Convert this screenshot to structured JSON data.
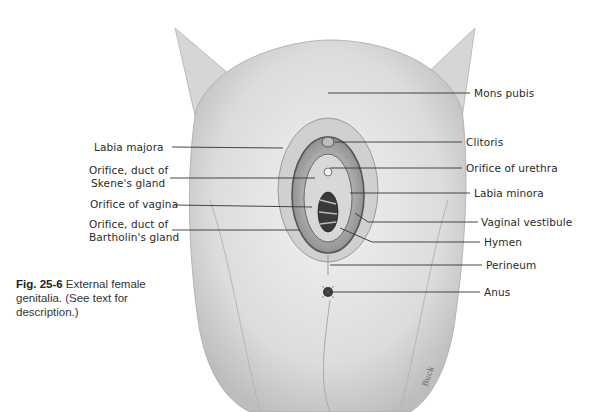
{
  "figure": {
    "number_label": "Fig. 25-6",
    "caption_text": "External female genitalia. (See text for description.)",
    "artist_signature": "Buck"
  },
  "labels_left": [
    {
      "id": "labia-majora",
      "text": "Labia majora"
    },
    {
      "id": "skene-gland-line1",
      "text": "Orifice, duct of"
    },
    {
      "id": "skene-gland-line2",
      "text": "Skene's gland"
    },
    {
      "id": "orifice-vagina",
      "text": "Orifice of vagina"
    },
    {
      "id": "bartholin-gland-line1",
      "text": "Orifice, duct of"
    },
    {
      "id": "bartholin-gland-line2",
      "text": "Bartholin's gland"
    }
  ],
  "labels_right": [
    {
      "id": "mons-pubis",
      "text": "Mons pubis"
    },
    {
      "id": "clitoris",
      "text": "Clitoris"
    },
    {
      "id": "orifice-urethra",
      "text": "Orifice of urethra"
    },
    {
      "id": "labia-minora",
      "text": "Labia minora"
    },
    {
      "id": "vaginal-vestibule",
      "text": "Vaginal vestibule"
    },
    {
      "id": "hymen",
      "text": "Hymen"
    },
    {
      "id": "perineum",
      "text": "Perineum"
    },
    {
      "id": "anus",
      "text": "Anus"
    }
  ]
}
